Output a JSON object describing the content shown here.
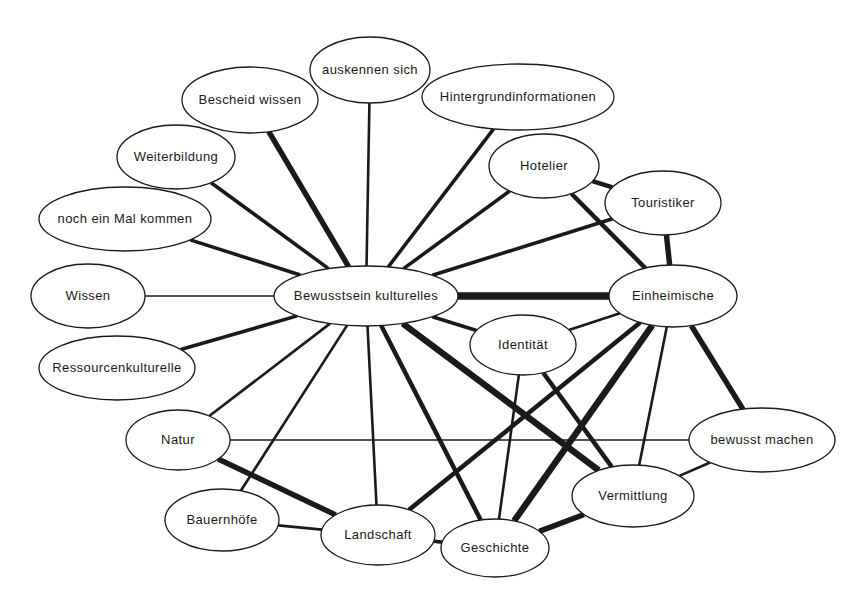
{
  "diagram": {
    "type": "concept-network-map",
    "background_color": "#ffffff",
    "line_color": "#1a1a1a",
    "node_fill": "#ffffff",
    "nodes": [
      {
        "id": "auskennen",
        "label": "auskennen sich",
        "cx": 370,
        "cy": 70,
        "rx": 60,
        "ry": 33,
        "font_size": 13
      },
      {
        "id": "bescheid",
        "label": "Bescheid wissen",
        "cx": 250,
        "cy": 100,
        "rx": 68,
        "ry": 33,
        "font_size": 13
      },
      {
        "id": "hintergrund",
        "label": "Hintergrundinformationen",
        "cx": 518,
        "cy": 97,
        "rx": 96,
        "ry": 33,
        "font_size": 13
      },
      {
        "id": "weiterbildung",
        "label": "Weiterbildung",
        "cx": 176,
        "cy": 157,
        "rx": 59,
        "ry": 32,
        "font_size": 13
      },
      {
        "id": "hotelier",
        "label": "Hotelier",
        "cx": 544,
        "cy": 166,
        "rx": 55,
        "ry": 32,
        "font_size": 13
      },
      {
        "id": "touristiker",
        "label": "Touristiker",
        "cx": 663,
        "cy": 203,
        "rx": 58,
        "ry": 32,
        "font_size": 13
      },
      {
        "id": "nochmal",
        "label": "noch ein Mal kommen",
        "cx": 125,
        "cy": 219,
        "rx": 86,
        "ry": 32,
        "font_size": 13
      },
      {
        "id": "wissen",
        "label": "Wissen",
        "cx": 88,
        "cy": 296,
        "rx": 57,
        "ry": 32,
        "font_size": 13
      },
      {
        "id": "bewusstsein",
        "label": "Bewusstsein kulturelles",
        "cx": 366,
        "cy": 296,
        "rx": 92,
        "ry": 30,
        "font_size": 13
      },
      {
        "id": "einheimische",
        "label": "Einheimische",
        "cx": 673,
        "cy": 296,
        "rx": 64,
        "ry": 31,
        "font_size": 13
      },
      {
        "id": "identitaet",
        "label": "Identität",
        "cx": 523,
        "cy": 345,
        "rx": 53,
        "ry": 30,
        "font_size": 13
      },
      {
        "id": "ressourcen",
        "label": "Ressourcenkulturelle",
        "cx": 117,
        "cy": 368,
        "rx": 78,
        "ry": 32,
        "font_size": 13
      },
      {
        "id": "natur",
        "label": "Natur",
        "cx": 178,
        "cy": 440,
        "rx": 52,
        "ry": 30,
        "font_size": 13
      },
      {
        "id": "bewusstmachen",
        "label": "bewusst machen",
        "cx": 762,
        "cy": 440,
        "rx": 73,
        "ry": 32,
        "font_size": 13
      },
      {
        "id": "vermittlung",
        "label": "Vermittlung",
        "cx": 633,
        "cy": 496,
        "rx": 61,
        "ry": 31,
        "font_size": 13
      },
      {
        "id": "bauernhoefe",
        "label": "Bauernhöfe",
        "cx": 222,
        "cy": 520,
        "rx": 57,
        "ry": 31,
        "font_size": 13
      },
      {
        "id": "landschaft",
        "label": "Landschaft",
        "cx": 378,
        "cy": 535,
        "rx": 57,
        "ry": 30,
        "font_size": 13
      },
      {
        "id": "geschichte",
        "label": "Geschichte",
        "cx": 495,
        "cy": 548,
        "rx": 54,
        "ry": 29,
        "font_size": 13
      }
    ],
    "edges": [
      {
        "from": "bescheid",
        "to": "bewusstsein",
        "weight": 5
      },
      {
        "from": "auskennen",
        "to": "bewusstsein",
        "weight": 2
      },
      {
        "from": "hintergrund",
        "to": "bewusstsein",
        "weight": 3
      },
      {
        "from": "weiterbildung",
        "to": "bewusstsein",
        "weight": 3
      },
      {
        "from": "nochmal",
        "to": "bewusstsein",
        "weight": 3
      },
      {
        "from": "wissen",
        "to": "bewusstsein",
        "weight": 1
      },
      {
        "from": "ressourcen",
        "to": "bewusstsein",
        "weight": 3
      },
      {
        "from": "hotelier",
        "to": "bewusstsein",
        "weight": 3
      },
      {
        "from": "touristiker",
        "to": "bewusstsein",
        "weight": 3
      },
      {
        "from": "bewusstsein",
        "to": "einheimische",
        "weight": 7
      },
      {
        "from": "bewusstsein",
        "to": "identitaet",
        "weight": 3
      },
      {
        "from": "bewusstsein",
        "to": "natur",
        "weight": 2
      },
      {
        "from": "bewusstsein",
        "to": "bauernhoefe",
        "weight": 2
      },
      {
        "from": "bewusstsein",
        "to": "landschaft",
        "weight": 2
      },
      {
        "from": "bewusstsein",
        "to": "geschichte",
        "weight": 4
      },
      {
        "from": "bewusstsein",
        "to": "vermittlung",
        "weight": 6
      },
      {
        "from": "hotelier",
        "to": "touristiker",
        "weight": 4
      },
      {
        "from": "hotelier",
        "to": "einheimische",
        "weight": 4
      },
      {
        "from": "touristiker",
        "to": "einheimische",
        "weight": 5
      },
      {
        "from": "einheimische",
        "to": "identitaet",
        "weight": 2
      },
      {
        "from": "einheimische",
        "to": "landschaft",
        "weight": 4
      },
      {
        "from": "einheimische",
        "to": "geschichte",
        "weight": 6
      },
      {
        "from": "einheimische",
        "to": "vermittlung",
        "weight": 2
      },
      {
        "from": "einheimische",
        "to": "bewusstmachen",
        "weight": 5
      },
      {
        "from": "identitaet",
        "to": "geschichte",
        "weight": 2
      },
      {
        "from": "identitaet",
        "to": "vermittlung",
        "weight": 4
      },
      {
        "from": "natur",
        "to": "bewusstmachen",
        "weight": 1
      },
      {
        "from": "natur",
        "to": "landschaft",
        "weight": 5
      },
      {
        "from": "bauernhoefe",
        "to": "landschaft",
        "weight": 2
      },
      {
        "from": "landschaft",
        "to": "geschichte",
        "weight": 3
      },
      {
        "from": "geschichte",
        "to": "vermittlung",
        "weight": 5
      },
      {
        "from": "vermittlung",
        "to": "bewusstmachen",
        "weight": 2
      }
    ]
  }
}
